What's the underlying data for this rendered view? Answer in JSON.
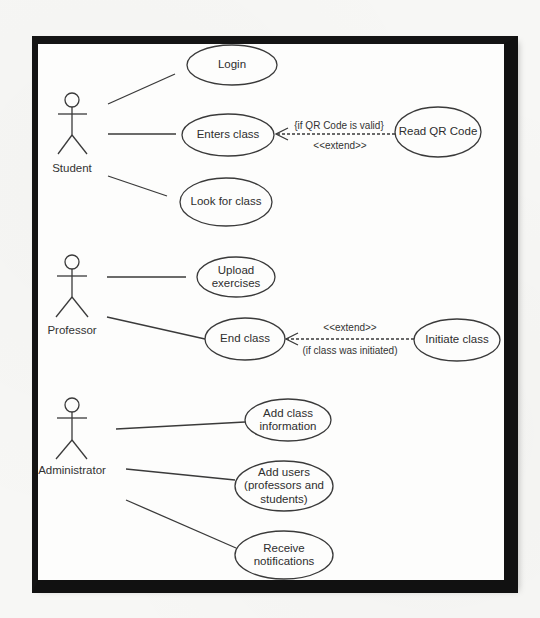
{
  "diagram": {
    "type": "uml-use-case",
    "colors": {
      "frame": "#111111",
      "stroke": "#333333",
      "background": "#fdfdfc"
    },
    "actors": [
      {
        "id": "student",
        "label": "Student"
      },
      {
        "id": "professor",
        "label": "Professor"
      },
      {
        "id": "administrator",
        "label": "Administrator"
      }
    ],
    "use_cases": {
      "login": "Login",
      "enters_class": "Enters class",
      "read_qr_code": "Read QR Code",
      "look_for_class": "Look for class",
      "upload_exercises": "Upload exercises",
      "end_class": "End class",
      "initiate_class": "Initiate class",
      "add_class_information": "Add class information",
      "add_users": "Add users (professors and students)",
      "receive_notifications": "Receive notifications"
    },
    "use_case_lines": {
      "upload_exercises": [
        "Upload",
        "exercises"
      ],
      "add_class_information": [
        "Add class",
        "information"
      ],
      "add_users": [
        "Add users",
        "(professors and",
        "students)"
      ],
      "receive_notifications": [
        "Receive",
        "notifications"
      ]
    },
    "relations": [
      {
        "type": "extend",
        "from": "Read QR Code",
        "to": "Enters class",
        "stereotype": "<<extend>>",
        "condition": "{if QR Code is valid}"
      },
      {
        "type": "extend",
        "from": "Initiate class",
        "to": "End class",
        "stereotype": "<<extend>>",
        "condition": "(if class was initiated)"
      }
    ],
    "associations": [
      [
        "Student",
        "Login"
      ],
      [
        "Student",
        "Enters class"
      ],
      [
        "Student",
        "Look for class"
      ],
      [
        "Professor",
        "Upload exercises"
      ],
      [
        "Professor",
        "End class"
      ],
      [
        "Administrator",
        "Add class information"
      ],
      [
        "Administrator",
        "Add users (professors and students)"
      ],
      [
        "Administrator",
        "Receive notifications"
      ]
    ],
    "labels": {
      "extend_1_stereotype": "<<extend>>",
      "extend_1_condition": "{if QR Code is valid}",
      "extend_2_stereotype": "<<extend>>",
      "extend_2_condition": "(if class was initiated)"
    }
  }
}
